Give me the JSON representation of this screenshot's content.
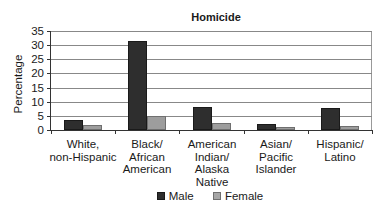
{
  "chart_data": {
    "type": "bar",
    "title": "Homicide",
    "xlabel": "",
    "ylabel": "Percentage",
    "ylim": [
      0,
      35
    ],
    "yticks": [
      0,
      5,
      10,
      15,
      20,
      25,
      30,
      35
    ],
    "grid": true,
    "legend_position": "bottom",
    "categories": [
      "White,\nnon-Hispanic",
      "Black/\nAfrican\nAmerican",
      "American\nIndian/\nAlaska\nNative",
      "Asian/\nPacific\nIslander",
      "Hispanic/\nLatino"
    ],
    "series": [
      {
        "name": "Male",
        "color": "#2e2e2e",
        "values": [
          3.5,
          31.5,
          8.0,
          2.2,
          7.7
        ]
      },
      {
        "name": "Female",
        "color": "#9d9d9d",
        "values": [
          1.8,
          4.9,
          2.4,
          0.9,
          1.4
        ]
      }
    ]
  },
  "ytick_labels": [
    "35",
    "30",
    "25",
    "20",
    "15",
    "10",
    "5",
    "0"
  ],
  "legend": {
    "male_label": "Male",
    "female_label": "Female"
  }
}
